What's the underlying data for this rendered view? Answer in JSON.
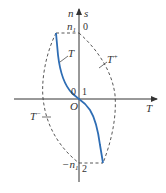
{
  "diagram": {
    "type": "torque-speed characteristic",
    "axes": {
      "vertical_left_label": "n",
      "vertical_right_label": "s",
      "horizontal_label": "T",
      "origin_label": "O"
    },
    "ticks": {
      "top_left": "n",
      "top_left_sub": "1",
      "top_right": "0",
      "mid_left": "0",
      "mid_right": "1",
      "bottom_left": "−n",
      "bottom_left_sub": "1",
      "bottom_right": "2"
    },
    "curves": [
      {
        "name": "T",
        "style": "solid",
        "color": "#2e6db4"
      },
      {
        "name": "T",
        "sup": "+",
        "style": "dashed",
        "color": "#444444"
      },
      {
        "name": "T",
        "sup": "−",
        "style": "dashed",
        "color": "#444444"
      }
    ],
    "colors": {
      "curve": "#2e6db4",
      "axis": "#333333",
      "dashed": "#444444"
    }
  }
}
